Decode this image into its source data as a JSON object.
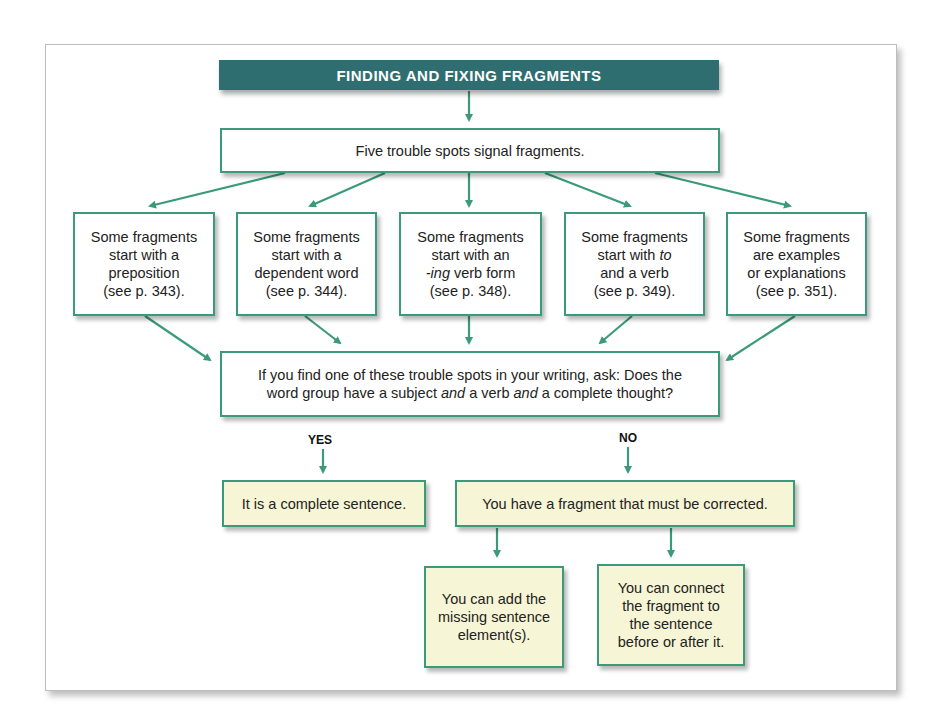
{
  "title": "FINDING AND FIXING FRAGMENTS",
  "top_box": "Five trouble spots signal fragments.",
  "trouble_spots": [
    {
      "line1": "Some fragments",
      "line2": "start with a",
      "line3": "preposition",
      "line4": "(see p. 343)."
    },
    {
      "line1": "Some fragments",
      "line2": "start with a",
      "line3": "dependent word",
      "line4": "(see p. 344)."
    },
    {
      "line1": "Some fragments",
      "line2": "start with an",
      "line3_italic": "-ing",
      "line3_rest": " verb form",
      "line4": "(see p. 348)."
    },
    {
      "line1": "Some fragments",
      "line2_pre": "start with ",
      "line2_italic": "to",
      "line3": "and a verb",
      "line4": "(see p. 349)."
    },
    {
      "line1": "Some fragments",
      "line2": "are examples",
      "line3": "or explanations",
      "line4": "(see p. 351)."
    }
  ],
  "question": {
    "line1": "If you find one of these trouble spots in your writing, ask: Does the",
    "line2_a": "word group have a subject ",
    "line2_and1": "and",
    "line2_b": " a verb ",
    "line2_and2": "and",
    "line2_c": " a complete thought?"
  },
  "yes_label": "YES",
  "no_label": "NO",
  "yes_result": "It is a complete sentence.",
  "no_result": "You have a fragment that must be corrected.",
  "fixes": [
    {
      "lines": [
        "You can add the",
        "missing sentence",
        "element(s)."
      ]
    },
    {
      "lines": [
        "You can connect",
        "the fragment to",
        "the sentence",
        "before or after it."
      ]
    }
  ],
  "colors": {
    "title_bg": "#2e6e70",
    "accent": "#3a9a7a",
    "note_bg": "#f6f5d6"
  }
}
